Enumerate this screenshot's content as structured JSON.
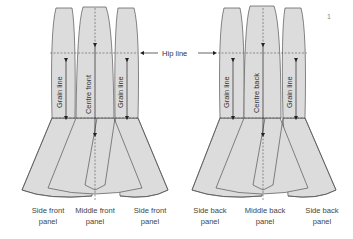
{
  "figure_number": "1",
  "hip_line_label": "Hip line",
  "colors": {
    "panel_fill": "#dcdcdc",
    "panel_stroke": "#555555",
    "text": "#333333",
    "dashed": "#555555"
  },
  "front_group": {
    "panels": [
      {
        "grain_label": "Grain line",
        "caption_line1": "Side front",
        "caption_line2": "panel"
      },
      {
        "grain_label": "Centre front",
        "caption_line1": "Middle front",
        "caption_line2": "panel"
      },
      {
        "grain_label": "Grain line",
        "caption_line1": "Side front",
        "caption_line2": "panel"
      }
    ]
  },
  "back_group": {
    "panels": [
      {
        "grain_label": "Grain line",
        "caption_line1": "Side back",
        "caption_line2": "panel"
      },
      {
        "grain_label": "Centre back",
        "caption_line1": "Middle back",
        "caption_line2": "panel"
      },
      {
        "grain_label": "Grain line",
        "caption_line1": "Side back",
        "caption_line2": "panel"
      }
    ]
  }
}
